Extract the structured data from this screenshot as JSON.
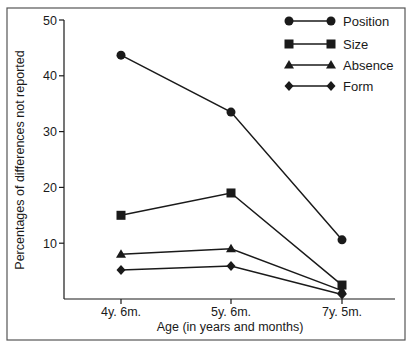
{
  "chart_data": {
    "type": "line",
    "title": "",
    "xlabel": "Age (in years and months)",
    "ylabel": "Percentages of differences not reported",
    "categories": [
      "4y. 6m.",
      "5y. 6m.",
      "7y. 5m."
    ],
    "yticks": [
      10,
      20,
      30,
      40,
      50
    ],
    "ylim": [
      0,
      50
    ],
    "grid": false,
    "legend_position": "top-right",
    "series": [
      {
        "name": "Position",
        "marker": "circle",
        "values": [
          43.7,
          33.5,
          10.6
        ]
      },
      {
        "name": "Size",
        "marker": "square",
        "values": [
          15.0,
          19.0,
          2.5
        ]
      },
      {
        "name": "Absence",
        "marker": "triangle",
        "values": [
          8.0,
          9.0,
          1.5
        ]
      },
      {
        "name": "Form",
        "marker": "diamond",
        "values": [
          5.2,
          5.9,
          0.8
        ]
      }
    ]
  },
  "colors": {
    "line": "#1a1a1a",
    "background": "#ffffff",
    "frame": "#555555"
  }
}
